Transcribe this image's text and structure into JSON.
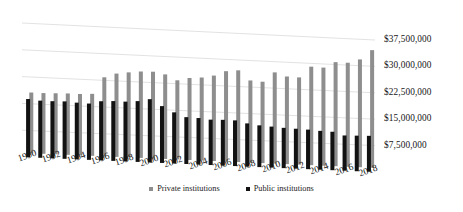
{
  "chart_data": {
    "type": "bar",
    "title": "",
    "subtitle": "",
    "xlabel": "",
    "ylabel": "",
    "grid": true,
    "legend_position": "bottom",
    "ylim": [
      0,
      37500000
    ],
    "ytick_labels": [
      "$7,500,000",
      "$15,000,000",
      "$22,500,000",
      "$30,000,000",
      "$37,500,000"
    ],
    "ytick_values": [
      7500000,
      15000000,
      22500000,
      30000000,
      37500000
    ],
    "categories": [
      "1990",
      "1991",
      "1992",
      "1993",
      "1994",
      "1995",
      "1996",
      "1997",
      "1998",
      "1999",
      "2000",
      "2001",
      "2002",
      "2003",
      "2004",
      "2005",
      "2006",
      "2007",
      "2008",
      "2009",
      "2010",
      "2011",
      "2012",
      "2013",
      "2014",
      "2015",
      "2016",
      "2017",
      "2018"
    ],
    "xtick_labels": [
      "1990",
      "1992",
      "1994",
      "1996",
      "1998",
      "2000",
      "2002",
      "2004",
      "2006",
      "2008",
      "2010",
      "2012",
      "2014",
      "2016",
      "2018"
    ],
    "series": [
      {
        "name": "Private institutions",
        "color": "#8e8e8e",
        "values": [
          17000000,
          17000000,
          17100000,
          17200000,
          17200000,
          17400000,
          22200000,
          23400000,
          23900000,
          24300000,
          24400000,
          23800000,
          22300000,
          23100000,
          23400000,
          24100000,
          25500000,
          25900000,
          23200000,
          23000000,
          25800000,
          24800000,
          24700000,
          27900000,
          27800000,
          29500000,
          29500000,
          30600000,
          33400000
        ]
      },
      {
        "name": "Public institutions",
        "color": "#121212",
        "values": [
          16300000,
          16000000,
          16000000,
          16100000,
          15900000,
          15800000,
          16600000,
          16800000,
          16800000,
          17100000,
          17800000,
          16000000,
          14400000,
          13200000,
          13100000,
          12800000,
          12900000,
          12900000,
          12200000,
          11800000,
          11600000,
          11400000,
          11300000,
          11200000,
          11000000,
          10900000,
          10000000,
          10100000,
          10200000
        ]
      }
    ]
  },
  "legend": {
    "private_label": "Private institutions",
    "public_label": "Public institutions"
  }
}
